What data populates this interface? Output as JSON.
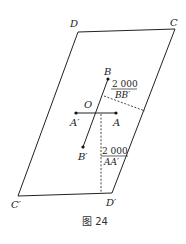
{
  "figure": {
    "caption": "图 24",
    "vertices": {
      "D": {
        "label": "D",
        "x": 78,
        "y": 32
      },
      "C": {
        "label": "C",
        "x": 175,
        "y": 29
      },
      "C_prime": {
        "label": "C′",
        "x": 18,
        "y": 196
      },
      "D_prime": {
        "label": "D′",
        "x": 112,
        "y": 193
      }
    },
    "points": {
      "B": {
        "label": "B",
        "x": 108,
        "y": 79
      },
      "B_prime": {
        "label": "B′",
        "x": 83,
        "y": 147
      },
      "A": {
        "label": "A",
        "x": 116,
        "y": 113
      },
      "A_prime": {
        "label": "A′",
        "x": 76,
        "y": 113
      },
      "O": {
        "label": "O"
      }
    },
    "annotations": {
      "bb": {
        "numerator": "2 000",
        "denominator": "BB′"
      },
      "aa": {
        "numerator": "2 000",
        "denominator": "AA′"
      }
    },
    "colors": {
      "line": "#222222",
      "dash": "#333333"
    }
  }
}
